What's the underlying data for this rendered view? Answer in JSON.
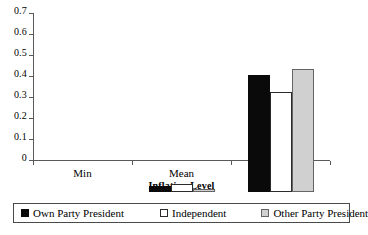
{
  "chart_data": {
    "type": "bar",
    "title": "",
    "subtitle": "",
    "xlabel": "Inflation Level",
    "ylabel": "",
    "categories": [
      "Min",
      "Mean",
      "Max"
    ],
    "series": [
      {
        "name": "Own Party President",
        "color": "#0a0a0a",
        "values": [
          0,
          0.029,
          0.555
        ]
      },
      {
        "name": "Independent",
        "color": "#ffffff",
        "values": [
          0,
          0.039,
          0.475
        ]
      },
      {
        "name": "Other Party President",
        "color": "#d0d0d0",
        "values": [
          0,
          0.015,
          0.585
        ]
      }
    ],
    "ylim": [
      0,
      0.7
    ],
    "ytick_values": [
      0,
      0.1,
      0.2,
      0.3,
      0.4,
      0.5,
      0.6,
      0.7
    ],
    "ytick_labels": [
      "0",
      "0.1",
      "0.2",
      "0.3",
      "0.4",
      "0.5",
      "0.6",
      "0.7"
    ],
    "grid": false,
    "legend_position": "bottom",
    "axis_color": "#5a5a5a"
  }
}
